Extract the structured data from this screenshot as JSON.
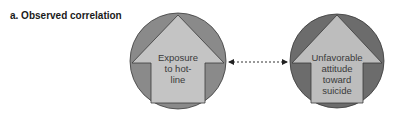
{
  "title": "a. Observed correlation",
  "nodes": [
    {
      "id": "left",
      "label_lines": [
        "Exposure",
        "to hot-",
        "line"
      ],
      "circle_color": "#8a8a8a",
      "arrow_color": "#c4c4c4"
    },
    {
      "id": "right",
      "label_lines": [
        "Unfavorable",
        "attitude",
        "toward",
        "suicide"
      ],
      "circle_color": "#6c6c6c",
      "arrow_color": "#bdbdbd"
    }
  ],
  "connector": {
    "style": "dotted",
    "direction": "bidirectional",
    "color": "#333333"
  }
}
